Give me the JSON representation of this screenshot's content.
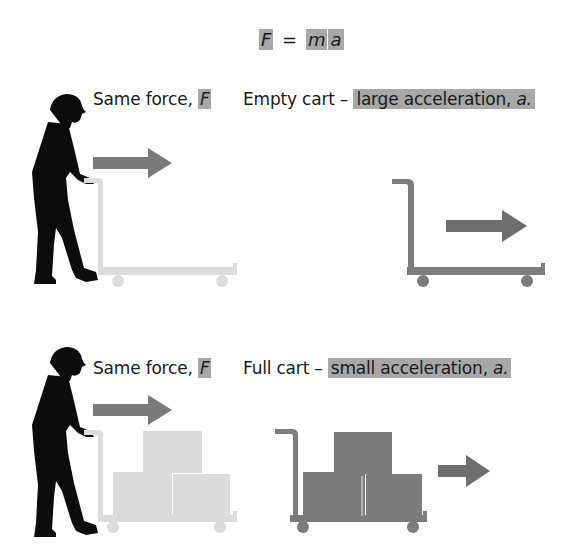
{
  "equation": {
    "force_symbol": "F",
    "equals": "=",
    "mass_symbol": "m",
    "acceleration_symbol": "a"
  },
  "panels": [
    {
      "id": "empty-cart",
      "force_label": "Same force,",
      "force_symbol": "F",
      "cart_label": "Empty cart –",
      "result_label": "large acceleration,",
      "result_symbol": "a.",
      "cart_load": "empty"
    },
    {
      "id": "full-cart",
      "force_label": "Same force,",
      "force_symbol": "F",
      "cart_label": "Full cart –",
      "result_label": "small acceleration,",
      "result_symbol": "a.",
      "cart_load": "full"
    }
  ],
  "colors": {
    "highlight": "#a8a8a8",
    "arrow": "#7a7a7a",
    "silhouette": "#0c0c0c",
    "ghost_cart": "#dcdcdc",
    "moved_cart": "#7c7c7c"
  }
}
